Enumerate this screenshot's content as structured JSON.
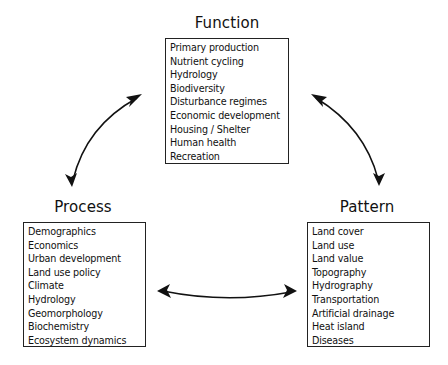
{
  "nodes": {
    "function": {
      "title": "Function",
      "items": [
        "Primary production",
        "Nutrient cycling",
        "Hydrology",
        "Biodiversity",
        "Disturbance regimes",
        "Economic development",
        "Housing / Shelter",
        "Human health",
        "Recreation"
      ]
    },
    "process": {
      "title": "Process",
      "items": [
        "Demographics",
        "Economics",
        "Urban development",
        "Land use policy",
        "Climate",
        "Hydrology",
        "Geomorphology",
        "Biochemistry",
        "Ecosystem dynamics"
      ]
    },
    "pattern": {
      "title": "Pattern",
      "items": [
        "Land cover",
        "Land use",
        "Land value",
        "Topography",
        "Hydrography",
        "Transportation",
        "Artificial drainage",
        "Heat island",
        "Diseases"
      ]
    }
  },
  "edges": [
    {
      "from": "function",
      "to": "process",
      "type": "bidirectional"
    },
    {
      "from": "function",
      "to": "pattern",
      "type": "bidirectional"
    },
    {
      "from": "process",
      "to": "pattern",
      "type": "bidirectional"
    }
  ],
  "colors": {
    "line": "#111111",
    "background": "#ffffff"
  }
}
